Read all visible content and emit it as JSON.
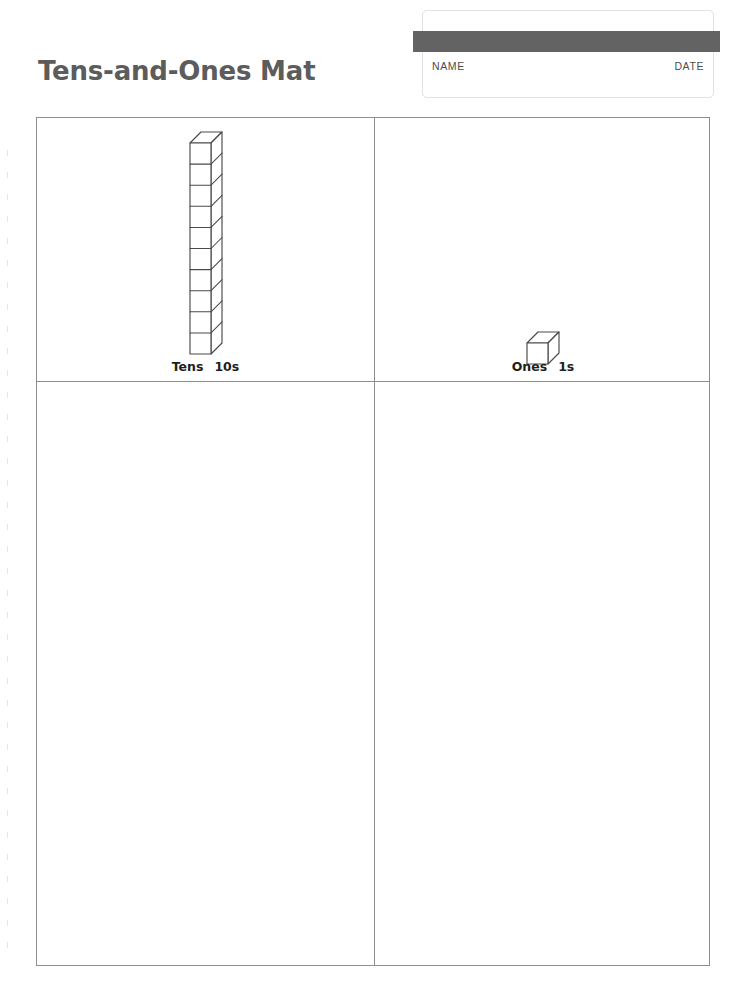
{
  "page": {
    "title": "Tens-and-Ones Mat",
    "background_color": "#ffffff",
    "title_color": "#5c5c5c",
    "rule_color": "#8d8d8d"
  },
  "name_date": {
    "band_color": "#636363",
    "name_label": "NAME",
    "date_label": "DATE"
  },
  "mat": {
    "columns": [
      {
        "key": "tens",
        "caption_name": "Tens",
        "caption_unit": "10s",
        "manipulative": "ten-rod",
        "cube_count": 10
      },
      {
        "key": "ones",
        "caption_name": "Ones",
        "caption_unit": "1s",
        "manipulative": "unit-cube",
        "cube_count": 1
      }
    ],
    "work_areas": [
      {
        "key": "tens-work",
        "value": ""
      },
      {
        "key": "ones-work",
        "value": ""
      }
    ]
  }
}
